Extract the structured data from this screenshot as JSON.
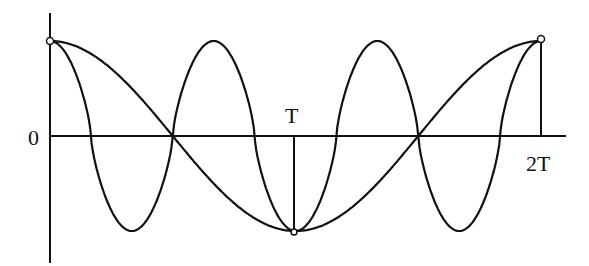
{
  "diagram": {
    "title": "",
    "labels": {
      "origin": "0",
      "half": "T",
      "full": "2T"
    },
    "geometry": {
      "x0": 50,
      "xT": 294,
      "x2T": 541,
      "xAxisEnd": 566,
      "yZero": 136,
      "yTop": 13,
      "yBottom": 263,
      "amplitude": 95
    },
    "curves": [
      {
        "name": "slow-cosine",
        "periods_over_2T": 1,
        "description": "one full cosine period from 0 to 2T"
      },
      {
        "name": "fast-cosine",
        "periods_over_2T": 3,
        "description": "three cosine periods from 0 to 2T"
      }
    ],
    "colors": {
      "line": "#111111",
      "background": "#ffffff"
    }
  }
}
